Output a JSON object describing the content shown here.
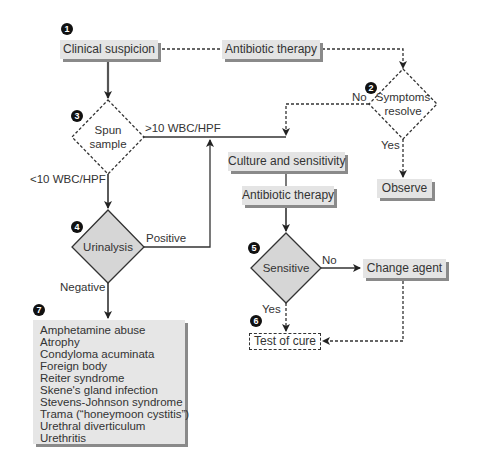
{
  "nodes": {
    "clinical_suspicion": "Clinical suspicion",
    "antibiotic_therapy_top": "Antibiotic therapy",
    "symptoms_resolve": [
      "Symptoms",
      "resolve"
    ],
    "spun_sample": [
      "Spun",
      "sample"
    ],
    "culture_sensitivity": "Culture and sensitivity",
    "antibiotic_therapy_mid": "Antibiotic therapy",
    "observe": "Observe",
    "urinalysis": "Urinalysis",
    "sensitive": "Sensitive",
    "change_agent": "Change agent",
    "test_of_cure": "Test of cure"
  },
  "edge_labels": {
    "no_symptoms": "No",
    "yes_symptoms": "Yes",
    "gt10": ">10 WBC/HPF",
    "lt10": "<10 WBC/HPF",
    "positive": "Positive",
    "negative": "Negative",
    "no_sensitive": "No",
    "yes_sensitive": "Yes"
  },
  "badges": [
    "1",
    "2",
    "3",
    "4",
    "5",
    "6",
    "7"
  ],
  "differential_list": [
    "Amphetamine abuse",
    "Atrophy",
    "Condyloma acuminata",
    "Foreign body",
    "Reiter syndrome",
    "Skene's gland infection",
    "Stevens-Johnson syndrome",
    "Trama (“honeymoon cystitis”)",
    "Urethral diverticulum",
    "Urethritis"
  ],
  "colors": {
    "box_fill": "#e4e4e4",
    "shadow": "#8a8a8a",
    "line": "#333333",
    "badge": "#111111"
  }
}
